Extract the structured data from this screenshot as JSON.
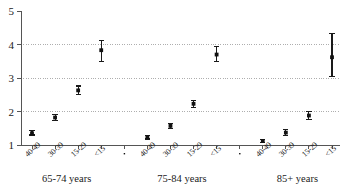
{
  "chart_data": {
    "type": "scatter",
    "title": "",
    "subtitle": "",
    "xlabel": "",
    "ylabel": "",
    "ylim": [
      1,
      5
    ],
    "yticks": [
      1,
      2,
      3,
      4,
      5
    ],
    "ytick_labels": [
      "1",
      "2",
      "3",
      "4",
      "5"
    ],
    "grid": "horizontal dotted gridlines at 2, 3 and 4",
    "gridlines": [
      2,
      3,
      4
    ],
    "legend": "none",
    "legend_position": "none",
    "error_bars": "vertical 95% confidence intervals with caps",
    "categories": [
      "40-49",
      "30-39",
      "15-29",
      "<15"
    ],
    "group_labels": [
      "65-74 years",
      "75-84 years",
      "85+ years"
    ],
    "groups": [
      {
        "name": "65-74 years",
        "points": [
          {
            "category": "40-49",
            "value": 1.35,
            "low": 1.3,
            "high": 1.42
          },
          {
            "category": "30-39",
            "value": 1.82,
            "low": 1.72,
            "high": 1.92
          },
          {
            "category": "15-29",
            "value": 2.63,
            "low": 2.5,
            "high": 2.76
          },
          {
            "category": "<15",
            "value": 3.83,
            "low": 3.5,
            "high": 4.12
          }
        ]
      },
      {
        "name": "75-84 years",
        "points": [
          {
            "category": "40-49",
            "value": 1.23,
            "low": 1.18,
            "high": 1.28
          },
          {
            "category": "30-39",
            "value": 1.57,
            "low": 1.49,
            "high": 1.65
          },
          {
            "category": "15-29",
            "value": 2.23,
            "low": 2.12,
            "high": 2.33
          },
          {
            "category": "<15",
            "value": 3.7,
            "low": 3.48,
            "high": 3.93
          }
        ]
      },
      {
        "name": "85+ years",
        "points": [
          {
            "category": "40-49",
            "value": 1.12,
            "low": 1.07,
            "high": 1.17
          },
          {
            "category": "30-39",
            "value": 1.37,
            "low": 1.29,
            "high": 1.45
          },
          {
            "category": "15-29",
            "value": 1.88,
            "low": 1.76,
            "high": 2.0
          },
          {
            "category": "<15",
            "value": 3.62,
            "low": 3.05,
            "high": 4.33
          }
        ]
      }
    ],
    "colors": {
      "marker": "#111111",
      "error_bar": "#1a1a1a",
      "axis": "#555555",
      "gridline": "#9a9a9a",
      "background": "#ffffff"
    }
  }
}
